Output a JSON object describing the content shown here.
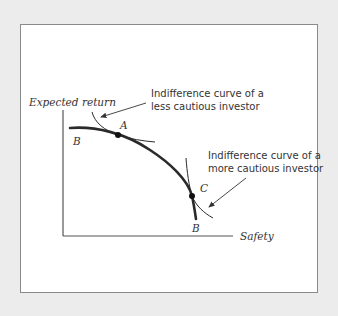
{
  "diagram": {
    "type": "indifference-curves-vs-opportunity-set",
    "axes": {
      "y_label": "Expected return",
      "x_label": "Safety"
    },
    "curve_labels": {
      "frontier_top": "B",
      "frontier_bottom": "B"
    },
    "points": [
      {
        "id": "A",
        "label": "A"
      },
      {
        "id": "C",
        "label": "C"
      }
    ],
    "annotations": {
      "less_cautious_line1": "Indifference curve of a",
      "less_cautious_line2": "less cautious investor",
      "more_cautious_line1": "Indifference curve of a",
      "more_cautious_line2": "more cautious investor"
    },
    "colors": {
      "background": "#ececec",
      "panel": "#ffffff",
      "frame_border": "#8a8a8a",
      "ink": "#333333"
    }
  }
}
